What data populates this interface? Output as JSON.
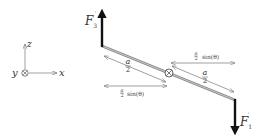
{
  "axes": {
    "z_label": "z",
    "x_label": "x",
    "y_label": "y",
    "y_symbol": "into-page (⊗)"
  },
  "forces": {
    "f3": {
      "symbol": "F",
      "subscript": "3",
      "direction": "up"
    },
    "f1": {
      "symbol": "F",
      "subscript": "1",
      "direction": "down"
    }
  },
  "pivot": {
    "symbol": "⊗"
  },
  "dimensions": {
    "left_length": {
      "num": "a",
      "den": "2"
    },
    "right_length": {
      "num": "a",
      "den": "2"
    },
    "left_horizontal": {
      "num": "a",
      "den": "2",
      "suffix": "sin(θ)"
    },
    "right_horizontal": {
      "num": "a",
      "den": "2",
      "suffix": "sin(θ)"
    }
  },
  "colors": {
    "bar": "#8a8a8a",
    "force": "#111111",
    "dimension": "#777777",
    "text": "#333333"
  }
}
